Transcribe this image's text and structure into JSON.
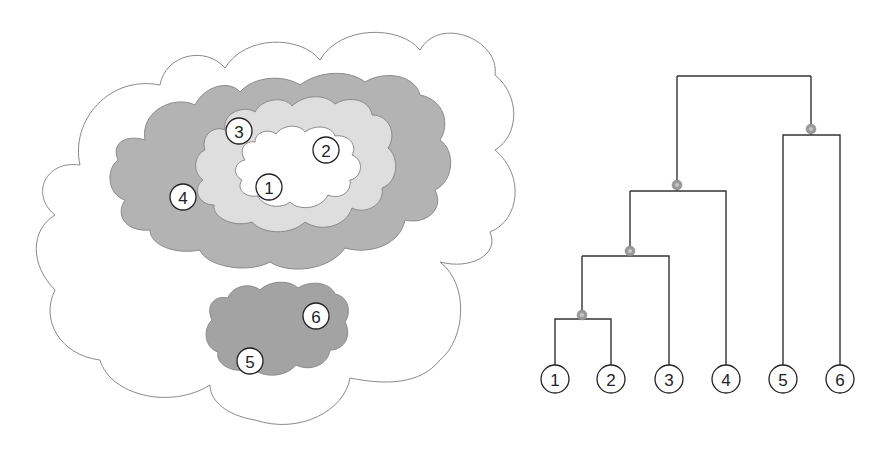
{
  "figure": {
    "left_panel": {
      "description": "Nested cluster clouds",
      "colors": {
        "outer_cloud": "#ffffff",
        "cluster_1234": "#b3b3b3",
        "cluster_123": "#dedede",
        "cluster_12": "#ffffff",
        "cluster_56": "#a3a3a3",
        "stroke": "#8a8a8a"
      },
      "labels": [
        {
          "id": "1",
          "text": "1",
          "x": 269,
          "y": 187
        },
        {
          "id": "2",
          "text": "2",
          "x": 326,
          "y": 150
        },
        {
          "id": "3",
          "text": "3",
          "x": 239,
          "y": 131
        },
        {
          "id": "4",
          "text": "4",
          "x": 183,
          "y": 197
        },
        {
          "id": "5",
          "text": "5",
          "x": 250,
          "y": 361
        },
        {
          "id": "6",
          "text": "6",
          "x": 316,
          "y": 316
        }
      ]
    },
    "dendrogram": {
      "leaves": [
        {
          "id": "1",
          "text": "1",
          "x": 555
        },
        {
          "id": "2",
          "text": "2",
          "x": 611
        },
        {
          "id": "3",
          "text": "3",
          "x": 669
        },
        {
          "id": "4",
          "text": "4",
          "x": 726
        },
        {
          "id": "5",
          "text": "5",
          "x": 783
        },
        {
          "id": "6",
          "text": "6",
          "x": 840
        }
      ],
      "leaf_y": 379,
      "merges": [
        {
          "children": [
            "1",
            "2"
          ],
          "height_y": 319,
          "node_x": 582
        },
        {
          "children": [
            "12",
            "3"
          ],
          "height_y": 256,
          "node_x": 630
        },
        {
          "children": [
            "123",
            "4"
          ],
          "height_y": 191,
          "node_x": 677
        },
        {
          "children": [
            "5",
            "6"
          ],
          "height_y": 135,
          "node_x": 811
        },
        {
          "children": [
            "1234",
            "56"
          ],
          "height_y": 76,
          "node_x": 744
        }
      ],
      "colors": {
        "line": "#333333",
        "node": "#9a9a9a"
      }
    }
  }
}
